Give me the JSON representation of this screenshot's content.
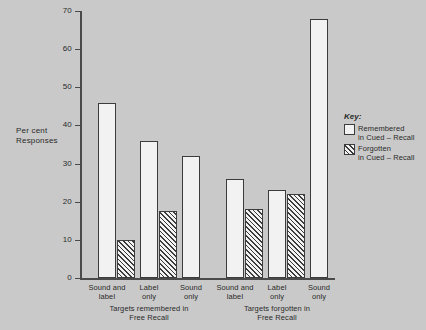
{
  "chart_data": {
    "type": "bar",
    "title": "",
    "xlabel": "",
    "ylabel": "Per cent\nResponses",
    "ylim": [
      0,
      70
    ],
    "ytick_step": 10,
    "yticks": [
      0,
      10,
      20,
      30,
      40,
      50,
      60,
      70
    ],
    "grid": false,
    "legend_position": "right",
    "categories": [
      "Sound and\nlabel",
      "Label\nonly",
      "Sound\nonly"
    ],
    "groups": [
      {
        "caption": "Targets remembered in\nFree Recall",
        "series": [
          {
            "name": "Remembered\nin Cued – Recall",
            "values": [
              46,
              36,
              32
            ]
          },
          {
            "name": "Forgotten\nin Cued – Recall",
            "values": [
              10,
              17.5,
              null
            ]
          }
        ]
      },
      {
        "caption": "Targets forgotten in\nFree Recall",
        "series": [
          {
            "name": "Remembered\nin Cued – Recall",
            "values": [
              26,
              23,
              68
            ]
          },
          {
            "name": "Forgotten\nin Cued – Recall",
            "values": [
              18,
              22,
              null
            ]
          }
        ]
      }
    ],
    "series_names": [
      "Remembered\nin Cued – Recall",
      "Forgotten\nin Cued – Recall"
    ],
    "colors": {
      "background": "#c9c9c9",
      "bar_fill": "#f2f2f2",
      "bar_outline": "#3c3c3c",
      "axis": "#4a4a4a",
      "text": "#2a2a2a"
    }
  },
  "legend": {
    "title": "Key:",
    "items": [
      {
        "swatch": "remembered",
        "label": "Remembered\nin Cued – Recall"
      },
      {
        "swatch": "forgotten",
        "label": "Forgotten\nin Cued – Recall"
      }
    ]
  },
  "axis": {
    "y_title": "Per cent\nResponses",
    "y_tick_labels": [
      "70",
      "60",
      "50",
      "40",
      "30",
      "20",
      "10",
      "0"
    ]
  },
  "groups_meta": [
    {
      "caption": "Targets remembered in\nFree Recall",
      "bars": [
        {
          "label": "Sound and\nlabel",
          "kind": "remembered",
          "value": 46
        },
        {
          "label": "",
          "kind": "forgotten",
          "value": 10
        },
        {
          "label": "Label\nonly",
          "kind": "remembered",
          "value": 36
        },
        {
          "label": "",
          "kind": "forgotten",
          "value": 17.5
        },
        {
          "label": "Sound\nonly",
          "kind": "remembered",
          "value": 32
        }
      ]
    },
    {
      "caption": "Targets forgotten in\nFree Recall",
      "bars": [
        {
          "label": "Sound and\nlabel",
          "kind": "remembered",
          "value": 26
        },
        {
          "label": "",
          "kind": "forgotten",
          "value": 18
        },
        {
          "label": "Label\nonly",
          "kind": "remembered",
          "value": 23
        },
        {
          "label": "",
          "kind": "forgotten",
          "value": 22
        },
        {
          "label": "Sound\nonly",
          "kind": "remembered",
          "value": 68
        }
      ]
    }
  ]
}
